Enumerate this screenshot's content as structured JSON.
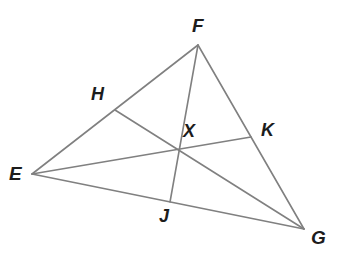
{
  "figure": {
    "background_color": "#ffffff",
    "stroke_color": "#808080",
    "label_color": "#1c1c1c",
    "stroke_width": 1.6,
    "width": 338,
    "height": 256
  },
  "labels": {
    "E": "E",
    "F": "F",
    "G": "G",
    "H": "H",
    "J": "J",
    "K": "K",
    "X": "X"
  },
  "geometry": {
    "points": {
      "E": {
        "x": 32,
        "y": 174
      },
      "F": {
        "x": 198,
        "y": 45
      },
      "G": {
        "x": 304,
        "y": 229
      },
      "H": {
        "x": 115,
        "y": 110
      },
      "J": {
        "x": 170,
        "y": 202
      },
      "K": {
        "x": 251,
        "y": 137
      },
      "X": {
        "x": 178,
        "y": 152
      }
    },
    "sides": [
      {
        "name": "EF",
        "from": "E",
        "to": "F"
      },
      {
        "name": "FG",
        "from": "F",
        "to": "G"
      },
      {
        "name": "EG",
        "from": "E",
        "to": "G"
      }
    ],
    "medians": [
      {
        "name": "FJ",
        "from": "F",
        "to": "J"
      },
      {
        "name": "EK",
        "from": "E",
        "to": "K"
      },
      {
        "name": "GH",
        "from": "G",
        "to": "H"
      }
    ],
    "label_positions": {
      "E": {
        "x": 9,
        "y": 164
      },
      "F": {
        "x": 192,
        "y": 16
      },
      "G": {
        "x": 311,
        "y": 228
      },
      "H": {
        "x": 91,
        "y": 85
      },
      "J": {
        "x": 159,
        "y": 207
      },
      "K": {
        "x": 261,
        "y": 121
      },
      "X": {
        "x": 183,
        "y": 122
      }
    }
  }
}
